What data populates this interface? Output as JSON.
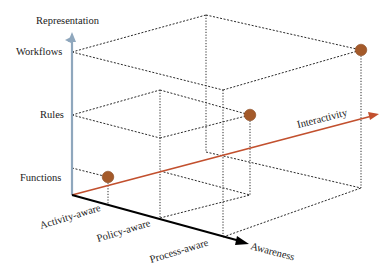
{
  "figure": {
    "type": "3d-axes-diagram",
    "axes": {
      "vertical": {
        "title": "Representation",
        "levels": [
          "Functions",
          "Rules",
          "Workflows"
        ],
        "color": "#8fa7bd"
      },
      "depth": {
        "title": "Awareness",
        "levels": [
          "Activity-aware",
          "Policy-aware",
          "Process-aware"
        ],
        "color": "#000000"
      },
      "horizontal": {
        "title": "Interactivity",
        "color": "#c2502e"
      }
    },
    "points": [
      {
        "representation": "Functions",
        "awareness": "Activity-aware",
        "label": "point-functions"
      },
      {
        "representation": "Rules",
        "awareness": "Policy-aware",
        "label": "point-rules"
      },
      {
        "representation": "Workflows",
        "awareness": "Process-aware",
        "label": "point-workflows"
      }
    ],
    "point_color": "#a45a2a"
  }
}
